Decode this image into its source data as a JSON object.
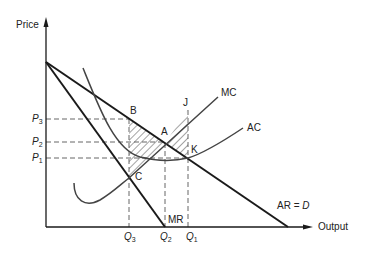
{
  "diagram": {
    "type": "monopoly-welfare-diagram",
    "axes": {
      "y_label": "Price",
      "x_label": "Output"
    },
    "curves": [
      {
        "id": "AR",
        "label": "AR = D",
        "label_main": "AR = ",
        "label_italic": "D"
      },
      {
        "id": "MR",
        "label": "MR"
      },
      {
        "id": "MC",
        "label": "MC"
      },
      {
        "id": "AC",
        "label": "AC"
      }
    ],
    "points": [
      "A",
      "B",
      "C",
      "J",
      "K"
    ],
    "price_levels": [
      {
        "id": "P3",
        "letter": "P",
        "sub": "3"
      },
      {
        "id": "P2",
        "letter": "P",
        "sub": "2"
      },
      {
        "id": "P1",
        "letter": "P",
        "sub": "1"
      }
    ],
    "quantity_levels": [
      {
        "id": "Q3",
        "letter": "Q",
        "sub": "3"
      },
      {
        "id": "Q2",
        "letter": "Q",
        "sub": "2"
      },
      {
        "id": "Q1",
        "letter": "Q",
        "sub": "1"
      }
    ],
    "shaded_regions": [
      "triangle B-A-C",
      "triangle A-J-K"
    ]
  },
  "colors": {
    "line": "#1a1a1a",
    "curve": "#444444",
    "dash": "#555555",
    "background": "#ffffff"
  }
}
